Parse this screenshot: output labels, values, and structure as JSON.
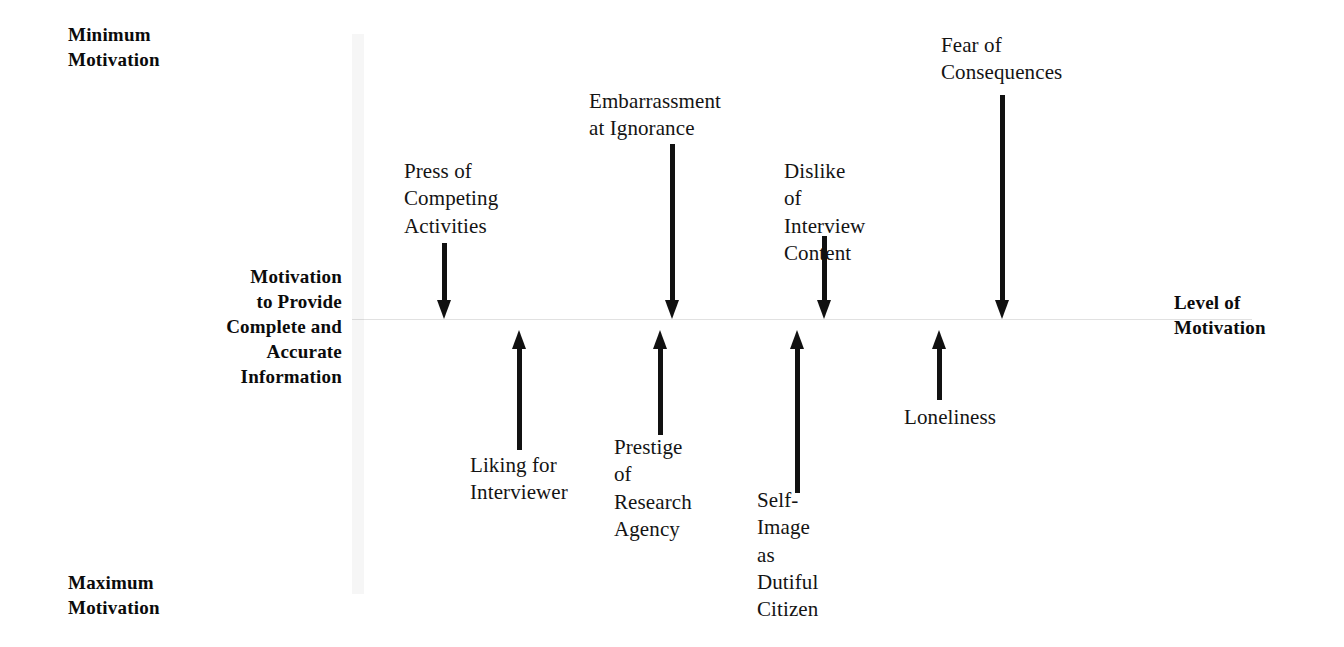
{
  "diagram": {
    "axis": {
      "minimum_label": "Minimum\nMotivation",
      "maximum_label": "Maximum\nMotivation",
      "left_label": "Motivation\nto Provide\nComplete and\nAccurate\nInformation",
      "right_label": "Level of\nMotivation"
    },
    "colors": {
      "arrow": "#111111",
      "text": "#141414",
      "axis_text": "#0b0b0b",
      "baseline": "#bdbdbd",
      "background": "#ffffff"
    },
    "negative_factors": [
      {
        "id": "press-of-competing-activities",
        "label": "Press of\nCompeting\nActivities",
        "direction": "down",
        "magnitude": "medium",
        "arrow_length_px": 76
      },
      {
        "id": "embarrassment-at-ignorance",
        "label": "Embarrassment\nat Ignorance",
        "direction": "down",
        "magnitude": "large",
        "arrow_length_px": 175
      },
      {
        "id": "dislike-of-interview-content",
        "label": "Dislike of\nInterview\nContent",
        "direction": "down",
        "magnitude": "medium",
        "arrow_length_px": 83
      },
      {
        "id": "fear-of-consequences",
        "label": "Fear of\nConsequences",
        "direction": "down",
        "magnitude": "largest",
        "arrow_length_px": 224
      }
    ],
    "positive_factors": [
      {
        "id": "liking-for-interviewer",
        "label": "Liking for\nInterviewer",
        "direction": "up",
        "magnitude": "medium",
        "arrow_length_px": 120
      },
      {
        "id": "prestige-of-research-agency",
        "label": "Prestige of\nResearch\nAgency",
        "direction": "up",
        "magnitude": "medium",
        "arrow_length_px": 105
      },
      {
        "id": "self-image-as-dutiful-citizen",
        "label": "Self-Image\nas Dutiful\nCitizen",
        "direction": "up",
        "magnitude": "large",
        "arrow_length_px": 163
      },
      {
        "id": "loneliness",
        "label": "Loneliness",
        "direction": "up",
        "magnitude": "small",
        "arrow_length_px": 70
      }
    ]
  }
}
